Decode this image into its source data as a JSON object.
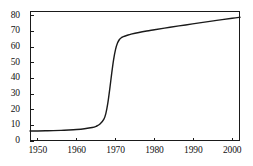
{
  "chart_data": {
    "type": "line",
    "title": "",
    "subtitle": "",
    "xlabel": "",
    "ylabel": "",
    "xlim": [
      1948,
      2002
    ],
    "ylim": [
      0,
      83
    ],
    "grid": false,
    "legend": null,
    "x_ticks": [
      1950,
      1960,
      1970,
      1980,
      1990,
      2000
    ],
    "x_tick_labels": [
      "1950",
      "1960",
      "1970",
      "1980",
      "1990",
      "2000"
    ],
    "y_ticks": [
      0,
      10,
      20,
      30,
      40,
      50,
      60,
      70,
      80
    ],
    "y_tick_labels": [
      "0",
      "10",
      "20",
      "30",
      "40",
      "50",
      "60",
      "70",
      "80"
    ],
    "series": [
      {
        "name": "series-1",
        "color": "#1a1a1a",
        "line_width": 1.4,
        "x": [
          1948,
          1950,
          1952,
          1954,
          1956,
          1958,
          1960,
          1962,
          1964,
          1965,
          1966,
          1967,
          1967.5,
          1968,
          1968.5,
          1969,
          1969.5,
          1970,
          1970.5,
          1971,
          1971.5,
          1972,
          1973,
          1974,
          1976,
          1978,
          1980,
          1984,
          1988,
          1992,
          1996,
          2000,
          2002
        ],
        "y": [
          6.4,
          6.4,
          6.5,
          6.6,
          6.8,
          7.0,
          7.3,
          7.8,
          8.6,
          9.4,
          10.8,
          14.0,
          17.5,
          24.0,
          33.0,
          43.0,
          52.0,
          58.5,
          62.5,
          64.8,
          66.0,
          66.7,
          67.5,
          68.2,
          69.3,
          70.2,
          71.0,
          72.6,
          74.1,
          75.6,
          77.0,
          78.4,
          79.0
        ]
      }
    ]
  }
}
